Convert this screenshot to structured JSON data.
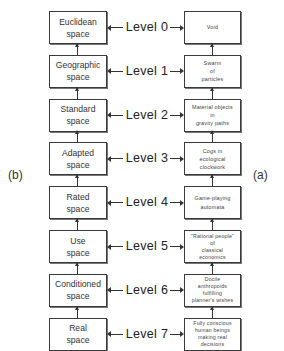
{
  "side_labels": {
    "left": "(b)",
    "right": "(a)"
  },
  "levels": [
    {
      "label": "Level 0",
      "space": [
        "Euclidean",
        "space"
      ],
      "entity": [
        "Void"
      ]
    },
    {
      "label": "Level 1",
      "space": [
        "Geographic",
        "space"
      ],
      "entity": [
        "Swarm",
        "of",
        "particles"
      ]
    },
    {
      "label": "Level 2",
      "space": [
        "Standard",
        "space"
      ],
      "entity": [
        "Material objects",
        "in",
        "gravity paths"
      ]
    },
    {
      "label": "Level 3",
      "space": [
        "Adapted",
        "space"
      ],
      "entity": [
        "Cogs in",
        "ecological",
        "clockwork"
      ]
    },
    {
      "label": "Level 4",
      "space": [
        "Rated",
        "space"
      ],
      "entity": [
        "Game-playing",
        "automata"
      ]
    },
    {
      "label": "Level 5",
      "space": [
        "Use",
        "space"
      ],
      "entity": [
        "\"Rational people\"",
        "of",
        "classical",
        "economics"
      ]
    },
    {
      "label": "Level 6",
      "space": [
        "Conditioned",
        "space"
      ],
      "entity": [
        "Docile",
        "anthropoids",
        "fulfilling",
        "planner's wishes"
      ]
    },
    {
      "label": "Level 7",
      "space": [
        "Real",
        "space"
      ],
      "entity": [
        "Fully conscious",
        "human beings",
        "making real",
        "decisions"
      ]
    }
  ],
  "colors": {
    "line": "#333333",
    "box_border": "#3a3a3a",
    "background": "#ffffff"
  }
}
